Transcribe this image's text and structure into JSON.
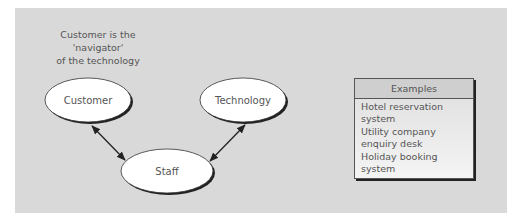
{
  "caption": {
    "line1": "Customer is the",
    "line2": "'navigator'",
    "line3": "of the technology"
  },
  "nodes": {
    "customer": "Customer",
    "technology": "Technology",
    "staff": "Staff"
  },
  "edges": [
    {
      "from": "Customer",
      "to": "Staff",
      "type": "bidirectional"
    },
    {
      "from": "Technology",
      "to": "Staff",
      "type": "bidirectional"
    }
  ],
  "examples": {
    "title": "Examples",
    "items": [
      "Hotel reservation system",
      "Utility company enquiry desk",
      "Holiday booking system"
    ]
  }
}
